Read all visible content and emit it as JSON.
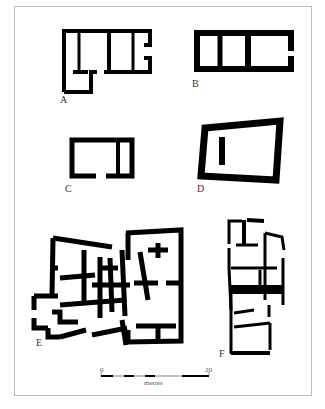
{
  "figure": {
    "type": "architectural floor plans",
    "plans": [
      {
        "id": "A",
        "label": "A"
      },
      {
        "id": "B",
        "label": "B"
      },
      {
        "id": "C",
        "label": "C"
      },
      {
        "id": "D",
        "label": "D"
      },
      {
        "id": "E",
        "label": "E"
      },
      {
        "id": "F",
        "label": "F"
      }
    ],
    "scale_bar": {
      "start_label": "0",
      "end_label": "20",
      "unit_label": "metres"
    },
    "colors": {
      "wall": "#000000",
      "background": "#ffffff",
      "frame": "#bdbdbd"
    }
  }
}
